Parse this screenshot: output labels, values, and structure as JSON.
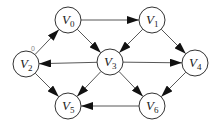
{
  "diagram": {
    "type": "directed-graph",
    "node_radius": 13,
    "nodes": [
      {
        "id": "V0",
        "letter": "V",
        "sub": "0",
        "x": 68,
        "y": 20
      },
      {
        "id": "V1",
        "letter": "V",
        "sub": "1",
        "x": 152,
        "y": 20
      },
      {
        "id": "V2",
        "letter": "V",
        "sub": "2",
        "x": 26,
        "y": 64
      },
      {
        "id": "V3",
        "letter": "V",
        "sub": "3",
        "x": 110,
        "y": 62
      },
      {
        "id": "V4",
        "letter": "V",
        "sub": "4",
        "x": 195,
        "y": 63
      },
      {
        "id": "V5",
        "letter": "V",
        "sub": "5",
        "x": 68,
        "y": 106
      },
      {
        "id": "V6",
        "letter": "V",
        "sub": "6",
        "x": 152,
        "y": 106
      }
    ],
    "edges": [
      {
        "from": "V0",
        "to": "V1"
      },
      {
        "from": "V0",
        "to": "V3"
      },
      {
        "from": "V2",
        "to": "V0",
        "label": "0"
      },
      {
        "from": "V1",
        "to": "V3"
      },
      {
        "from": "V1",
        "to": "V4"
      },
      {
        "from": "V3",
        "to": "V2"
      },
      {
        "from": "V3",
        "to": "V4"
      },
      {
        "from": "V3",
        "to": "V5"
      },
      {
        "from": "V3",
        "to": "V6"
      },
      {
        "from": "V2",
        "to": "V5"
      },
      {
        "from": "V4",
        "to": "V6"
      },
      {
        "from": "V6",
        "to": "V5"
      }
    ],
    "edge_label_0": "0"
  }
}
